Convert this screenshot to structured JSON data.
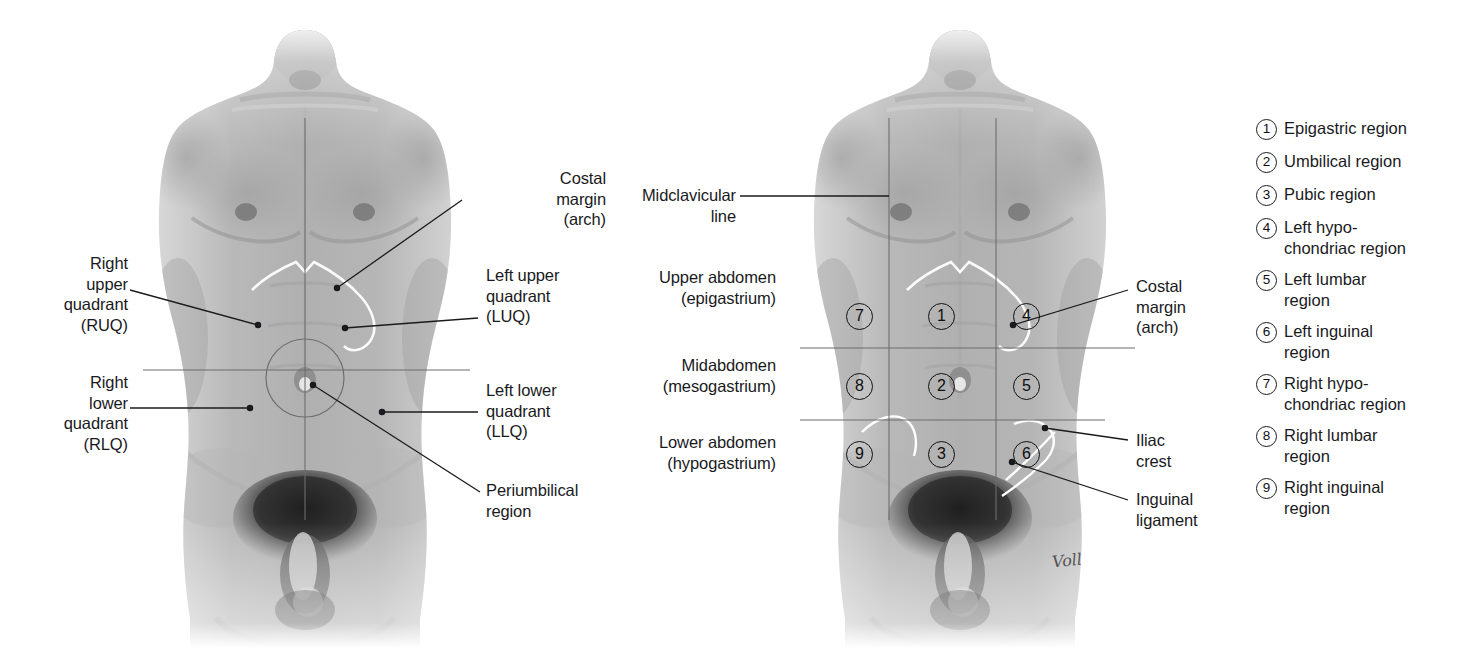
{
  "figures": {
    "left": {
      "name": "abdominal-quadrants-figure",
      "labels": [
        {
          "id": "right-upper-quadrant",
          "text": "Right\nupper\nquadrant\n(RUQ)"
        },
        {
          "id": "right-lower-quadrant",
          "text": "Right\nlower\nquadrant\n(RLQ)"
        },
        {
          "id": "costal-margin-left-fig",
          "text": "Costal\nmargin\n(arch)"
        },
        {
          "id": "left-upper-quadrant",
          "text": "Left upper\nquadrant\n(LUQ)"
        },
        {
          "id": "left-lower-quadrant",
          "text": "Left lower\nquadrant\n(LLQ)"
        },
        {
          "id": "periumbilical-region",
          "text": "Periumbilical\nregion"
        }
      ]
    },
    "right": {
      "name": "abdominal-regions-figure",
      "labels": [
        {
          "id": "midclavicular-line",
          "text": "Midclavicular\nline"
        },
        {
          "id": "upper-abdomen",
          "text": "Upper abdomen\n(epigastrium)"
        },
        {
          "id": "midabdomen",
          "text": "Midabdomen\n(mesogastrium)"
        },
        {
          "id": "lower-abdomen",
          "text": "Lower abdomen\n(hypogastrium)"
        },
        {
          "id": "costal-margin-right-fig",
          "text": "Costal\nmargin\n(arch)"
        },
        {
          "id": "iliac-crest",
          "text": "Iliac\ncrest"
        },
        {
          "id": "inguinal-ligament",
          "text": "Inguinal\nligament"
        }
      ],
      "region_numbers": [
        "7",
        "1",
        "4",
        "8",
        "2",
        "5",
        "9",
        "3",
        "6"
      ]
    }
  },
  "legend": {
    "items": [
      {
        "num": "1",
        "text": "Epigastric region"
      },
      {
        "num": "2",
        "text": "Umbilical region"
      },
      {
        "num": "3",
        "text": "Pubic region"
      },
      {
        "num": "4",
        "text": "Left hypo-\nchondriac region"
      },
      {
        "num": "5",
        "text": "Left lumbar\nregion"
      },
      {
        "num": "6",
        "text": "Left inguinal\nregion"
      },
      {
        "num": "7",
        "text": "Right hypo-\nchondriac region"
      },
      {
        "num": "8",
        "text": "Right lumbar\nregion"
      },
      {
        "num": "9",
        "text": "Right inguinal\nregion"
      }
    ]
  },
  "signature": {
    "text": "Voll"
  },
  "colors": {
    "text": "#1a1a1d",
    "leader_line": "#1b1b1e",
    "grid_line": "#6d6d70",
    "background": "#ffffff"
  }
}
